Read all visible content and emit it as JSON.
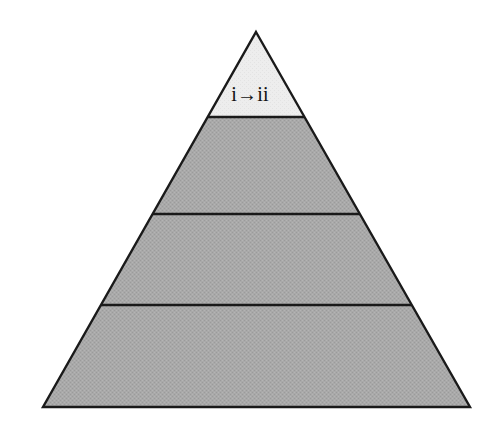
{
  "figure": {
    "kind": "pyramid-diagram",
    "background_color": "#ffffff",
    "outline_color": "#1a1a1a",
    "outline_width_px": 2,
    "apex": {
      "x": 256,
      "y": 32
    },
    "base_left": {
      "x": 43,
      "y": 407
    },
    "base_right": {
      "x": 470,
      "y": 407
    },
    "divider_y_values": [
      117,
      214,
      305
    ],
    "tiers": [
      {
        "index": 1,
        "label": "i→ii",
        "label_from": "i",
        "label_to": "ii",
        "fill_color": "#ededed",
        "position": "top",
        "y_top": 32,
        "y_bottom": 117
      },
      {
        "index": 2,
        "label": "",
        "fill_color": "#a9a9a9",
        "position": "upper-middle",
        "y_top": 117,
        "y_bottom": 214
      },
      {
        "index": 3,
        "label": "",
        "fill_color": "#a9a9a9",
        "position": "lower-middle",
        "y_top": 214,
        "y_bottom": 305
      },
      {
        "index": 4,
        "label": "",
        "fill_color": "#a9a9a9",
        "position": "base",
        "y_top": 305,
        "y_bottom": 407
      }
    ]
  }
}
